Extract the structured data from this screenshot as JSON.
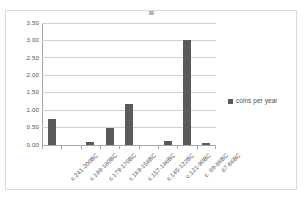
{
  "chart_data": {
    "type": "bar",
    "title": "",
    "xlabel": "",
    "ylabel": "",
    "ylim": [
      0.0,
      3.5
    ],
    "ytick_step": 0.5,
    "grid": true,
    "legend_position": "right",
    "series_name": "coins per year",
    "bar_color": "#5a5a5a",
    "categories": [
      "c.241-200BC",
      "c.199-180BC",
      "c.179-170BC",
      "c.169-158BC",
      "c.157-146BC",
      "c.145-122BC",
      "c.121-90BC",
      "c. 89-88BC",
      "87-66BC"
    ],
    "values": [
      0.75,
      0.0,
      0.1,
      0.48,
      1.17,
      0.0,
      0.11,
      3.0,
      0.07
    ],
    "ytick_labels": [
      "0.00",
      "0.50",
      "1.00",
      "1.50",
      "2.00",
      "2.50",
      "3.00",
      "3.50"
    ],
    "ytick_values": [
      0.0,
      0.5,
      1.0,
      1.5,
      2.0,
      2.5,
      3.0,
      3.5
    ]
  },
  "legend": {
    "swatch_name": "legend-color-swatch",
    "label": "coins per year"
  },
  "colors": {
    "bar": "#5a5a5a",
    "gridline": "#d0d0d0",
    "axis": "#a6a6a6",
    "border": "#d9d9d9",
    "text": "#555555"
  }
}
